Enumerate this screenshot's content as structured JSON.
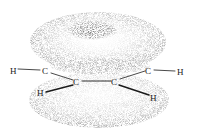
{
  "diagram": {
    "atoms": [
      {
        "id": "H1",
        "label": "H",
        "x": 13,
        "y": 72
      },
      {
        "id": "C1",
        "label": "C",
        "x": 46,
        "y": 72
      },
      {
        "id": "C2",
        "label": "C",
        "x": 77,
        "y": 83
      },
      {
        "id": "C3",
        "label": "C",
        "x": 115,
        "y": 83
      },
      {
        "id": "C4",
        "label": "C",
        "x": 149,
        "y": 72
      },
      {
        "id": "H2",
        "label": "H",
        "x": 181,
        "y": 72
      },
      {
        "id": "H3",
        "label": "H",
        "x": 40,
        "y": 94
      },
      {
        "id": "H4",
        "label": "H",
        "x": 154,
        "y": 98
      }
    ],
    "colors": {
      "lobe": "#9a9a9a",
      "lobe_dark": "#6a6a6a",
      "bond": "#1a1a1a"
    }
  }
}
